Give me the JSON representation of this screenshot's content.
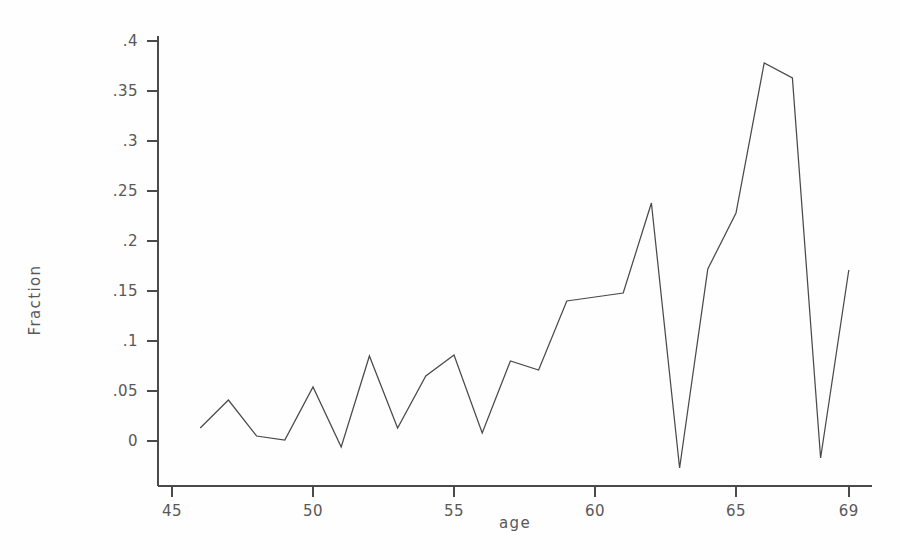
{
  "chart_data": {
    "type": "line",
    "title": "",
    "xlabel": "age",
    "ylabel": "Fraction",
    "xlim": [
      45,
      69
    ],
    "ylim": [
      -0.032,
      0.42
    ],
    "grid": false,
    "legend": false,
    "x_ticks": [
      "45",
      "50",
      "55",
      "60",
      "65",
      "69"
    ],
    "x_tick_values": [
      45,
      50,
      55,
      60,
      65,
      69
    ],
    "y_ticks": [
      "0",
      ".05",
      ".1",
      ".15",
      ".2",
      ".25",
      ".3",
      ".35",
      ".4"
    ],
    "y_tick_values": [
      0,
      0.05,
      0.1,
      0.15,
      0.2,
      0.25,
      0.3,
      0.35,
      0.4
    ],
    "x": [
      46,
      47,
      48,
      49,
      50,
      51,
      52,
      53,
      54,
      55,
      56,
      57,
      58,
      59,
      60,
      61,
      62,
      63,
      64,
      65,
      66,
      67,
      68,
      69
    ],
    "values": [
      0.013,
      0.041,
      0.005,
      0.001,
      0.054,
      -0.006,
      0.085,
      0.013,
      0.065,
      0.086,
      0.008,
      0.08,
      0.071,
      0.14,
      0.144,
      0.148,
      0.238,
      -0.027,
      0.172,
      0.228,
      0.378,
      0.363,
      -0.017,
      0.171
    ],
    "series": [
      {
        "name": "Fraction",
        "color": "#4a4a4a",
        "points": [
          [
            46,
            0.013
          ],
          [
            47,
            0.041
          ],
          [
            48,
            0.005
          ],
          [
            49,
            0.001
          ],
          [
            50,
            0.054
          ],
          [
            51,
            -0.006
          ],
          [
            52,
            0.085
          ],
          [
            53,
            0.013
          ],
          [
            54,
            0.065
          ],
          [
            55,
            0.086
          ],
          [
            56,
            0.008
          ],
          [
            57,
            0.08
          ],
          [
            58,
            0.071
          ],
          [
            59,
            0.14
          ],
          [
            60,
            0.144
          ],
          [
            61,
            0.148
          ],
          [
            62,
            0.238
          ],
          [
            63,
            -0.027
          ],
          [
            64,
            0.172
          ],
          [
            65,
            0.228
          ],
          [
            66,
            0.378
          ],
          [
            67,
            0.363
          ],
          [
            68,
            -0.017
          ],
          [
            69,
            0.171
          ]
        ]
      }
    ]
  },
  "axes": {
    "x_title": "age",
    "y_title": "Fraction"
  },
  "colors": {
    "line": "#4a4a4a",
    "axis": "#4a4a4a",
    "text": "#585858",
    "background": "#fefefe"
  }
}
